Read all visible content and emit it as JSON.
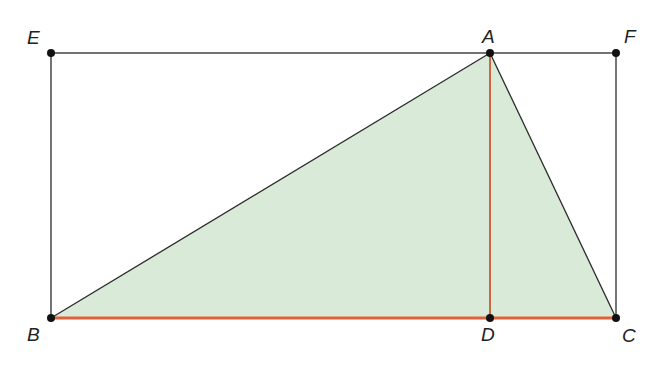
{
  "diagram": {
    "colors": {
      "fill": "#d9ead8",
      "line": "#2a2a2a",
      "highlight": "#e2603a",
      "point": "#111111"
    },
    "points": {
      "E": {
        "label": "E",
        "x": 51,
        "y": 53
      },
      "A": {
        "label": "A",
        "x": 490,
        "y": 53
      },
      "F": {
        "label": "F",
        "x": 616,
        "y": 53
      },
      "B": {
        "label": "B",
        "x": 51,
        "y": 318
      },
      "D": {
        "label": "D",
        "x": 490,
        "y": 318
      },
      "C": {
        "label": "C",
        "x": 616,
        "y": 318
      }
    },
    "shaded_triangle": [
      "A",
      "B",
      "C"
    ],
    "rectangle": [
      "E",
      "F",
      "C",
      "B"
    ],
    "highlighted_segments": [
      [
        "B",
        "C"
      ],
      [
        "A",
        "D"
      ]
    ]
  }
}
